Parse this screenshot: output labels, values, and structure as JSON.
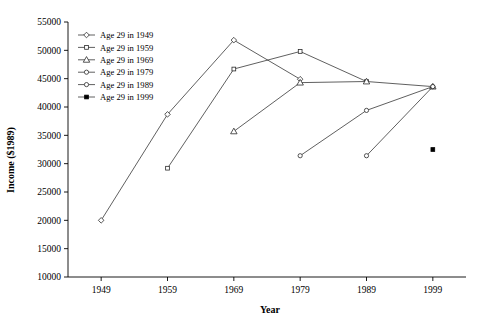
{
  "chart_data": {
    "type": "line",
    "title": "",
    "xlabel": "Year",
    "ylabel": "Income ($1989)",
    "x": [
      1949,
      1959,
      1969,
      1979,
      1989,
      1999
    ],
    "categories": [
      "1949",
      "1959",
      "1969",
      "1979",
      "1989",
      "1999"
    ],
    "xlim": [
      1944,
      2004
    ],
    "ylim": [
      10000,
      55000
    ],
    "ytick_values": [
      10000,
      15000,
      20000,
      25000,
      30000,
      35000,
      40000,
      45000,
      50000,
      55000
    ],
    "ytick_labels": [
      "10000",
      "15000",
      "20000",
      "25000",
      "30000",
      "35000",
      "40000",
      "45000",
      "50000",
      "55000"
    ],
    "xtick_labels": [
      "1949",
      "1959",
      "1969",
      "1979",
      "1989",
      "1999"
    ],
    "grid": false,
    "legend_position": "top-left-inside",
    "series": [
      {
        "name": "Age 29 in 1949",
        "marker": "diamond",
        "filled": false,
        "x": [
          1949,
          1959,
          1969,
          1979
        ],
        "values": [
          20000,
          38700,
          51800,
          44900
        ]
      },
      {
        "name": "Age 29 in 1959",
        "marker": "square",
        "filled": false,
        "x": [
          1959,
          1969,
          1979,
          1989
        ],
        "values": [
          29200,
          46700,
          49800,
          44500
        ]
      },
      {
        "name": "Age 29 in 1969",
        "marker": "triangle",
        "filled": false,
        "x": [
          1969,
          1979,
          1989,
          1999
        ],
        "values": [
          35700,
          44300,
          44500,
          43600
        ]
      },
      {
        "name": "Age 29 in 1979",
        "marker": "circle",
        "filled": false,
        "x": [
          1979,
          1989,
          1999
        ],
        "values": [
          31400,
          39400,
          43600
        ]
      },
      {
        "name": "Age 29 in 1989",
        "marker": "circle",
        "filled": false,
        "x": [
          1989,
          1999
        ],
        "values": [
          31400,
          43600
        ]
      },
      {
        "name": "Age 29 in 1999",
        "marker": "square",
        "filled": true,
        "x": [
          1999
        ],
        "values": [
          32500
        ]
      }
    ]
  },
  "legend": {
    "items": [
      {
        "label": "Age 29 in 1949",
        "marker": "diamond-open-icon"
      },
      {
        "label": "Age 29 in 1959",
        "marker": "square-open-icon"
      },
      {
        "label": "Age 29 in 1969",
        "marker": "triangle-open-icon"
      },
      {
        "label": "Age 29 in 1979",
        "marker": "circle-open-icon"
      },
      {
        "label": "Age 29 in 1989",
        "marker": "circle-open-icon"
      },
      {
        "label": "Age 29 in 1999",
        "marker": "square-filled-icon"
      }
    ]
  },
  "colors": {
    "axis": "#000000",
    "line": "#2b2b2b",
    "marker_fill": "#ffffff",
    "marker_filled": "#000000",
    "background": "#ffffff"
  }
}
